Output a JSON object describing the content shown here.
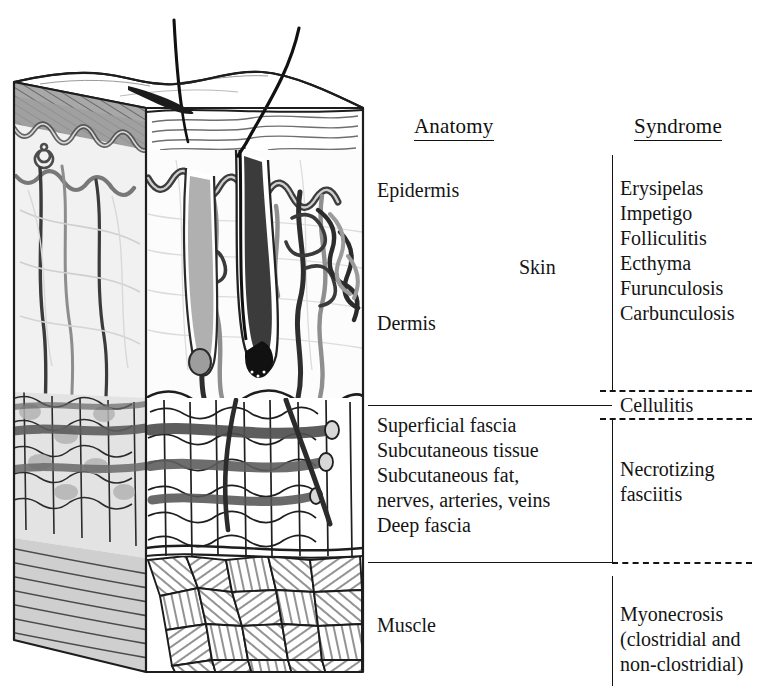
{
  "figure": {
    "type": "medical-anatomy-diagram"
  },
  "headers": {
    "anatomy": "Anatomy",
    "syndrome": "Syndrome"
  },
  "anatomy_labels": {
    "epidermis": "Epidermis",
    "dermis": "Dermis",
    "fascia_block": "Superficial fascia\nSubcutaneous tissue\nSubcutaneous fat,\nnerves, arteries, veins\nDeep fascia",
    "muscle": "Muscle"
  },
  "group_labels": {
    "skin": "Skin"
  },
  "syndrome_labels": {
    "skin_list": "Erysipelas\nImpetigo\nFolliculitis\nEcthyma\nFurunculosis\nCarbunculosis",
    "cellulitis": "Cellulitis",
    "necrotizing_fasciitis": "Necrotizing\nfasciitis",
    "myonecrosis": "Myonecrosis\n(clostridial and\nnon-clostridial)"
  },
  "illustration": {
    "description": "Three-dimensional cutaway block of skin showing hair shafts, epidermis, dermis with vascular plexus and hair follicles, subcutaneous fat with vessels, and striated muscle",
    "layers": [
      "epidermis",
      "dermis",
      "subcutaneous-fat",
      "muscle"
    ]
  },
  "colors": {
    "ink": "#141414",
    "gray_dark": "#6f6f6f",
    "gray_mid": "#9a9a9a",
    "gray_light": "#c9c9c9",
    "gray_pale": "#e6e6e6",
    "paper": "#ffffff"
  }
}
